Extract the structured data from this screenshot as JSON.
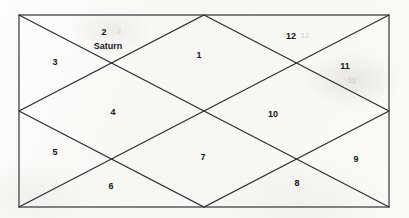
{
  "document": {
    "type": "north-indian-vedic-birth-chart",
    "title": "North Indian Vedic Astrology Chart"
  },
  "chart": {
    "frame": {
      "left": 19,
      "top": 15,
      "right": 389,
      "bottom": 207
    },
    "stroke_color": "#2b2b30",
    "background_color": "#fbfbf9",
    "text_color": "#16161a"
  },
  "houses": [
    {
      "number": "1",
      "x": 199,
      "y": 55,
      "planets": []
    },
    {
      "number": "2",
      "x": 104,
      "y": 32,
      "planets": [
        "Saturn"
      ]
    },
    {
      "number": "3",
      "x": 55,
      "y": 62,
      "planets": []
    },
    {
      "number": "4",
      "x": 113,
      "y": 112,
      "planets": []
    },
    {
      "number": "5",
      "x": 55,
      "y": 152,
      "planets": []
    },
    {
      "number": "6",
      "x": 111,
      "y": 186,
      "planets": []
    },
    {
      "number": "7",
      "x": 203,
      "y": 157,
      "planets": []
    },
    {
      "number": "8",
      "x": 297,
      "y": 183,
      "planets": []
    },
    {
      "number": "9",
      "x": 356,
      "y": 159,
      "planets": []
    },
    {
      "number": "10",
      "x": 273,
      "y": 114,
      "planets": []
    },
    {
      "number": "11",
      "x": 345,
      "y": 66,
      "planets": []
    },
    {
      "number": "12",
      "x": 291,
      "y": 36,
      "planets": []
    }
  ],
  "planet_placements": [
    {
      "name": "Saturn",
      "house": "2",
      "x": 108,
      "y": 46
    }
  ],
  "artifacts": [
    {
      "text": "2",
      "x": 119,
      "y": 31
    },
    {
      "text": "12",
      "x": 305,
      "y": 35
    },
    {
      "text": "11",
      "x": 352,
      "y": 80
    }
  ]
}
